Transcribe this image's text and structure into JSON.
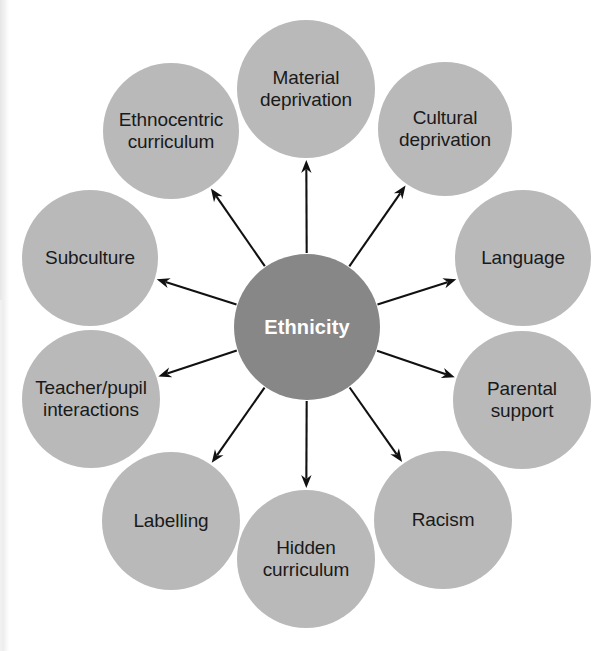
{
  "diagram": {
    "type": "radial-spoke",
    "title": "Ethnicity",
    "background_color": "#ffffff",
    "center": {
      "label": "Ethnicity",
      "cx": 307,
      "cy": 327,
      "r": 73,
      "fill": "#878787",
      "text_color": "#ffffff"
    },
    "node_style": {
      "fill": "#b9b9b9",
      "text_color": "#1a1a1a",
      "r": 69
    },
    "arrow_color": "#111111",
    "nodes": [
      {
        "id": "material-deprivation",
        "label": "Material\ndeprivation",
        "cx": 306,
        "cy": 89,
        "r": 69,
        "angle": -90
      },
      {
        "id": "cultural-deprivation",
        "label": "Cultural\ndeprivation",
        "cx": 445,
        "cy": 129,
        "r": 67,
        "angle": -54
      },
      {
        "id": "language",
        "label": "Language",
        "cx": 523,
        "cy": 258,
        "r": 68,
        "angle": -18
      },
      {
        "id": "parental-support",
        "label": "Parental\nsupport",
        "cx": 522,
        "cy": 400,
        "r": 69,
        "angle": 18
      },
      {
        "id": "racism",
        "label": "Racism",
        "cx": 443,
        "cy": 520,
        "r": 69,
        "angle": 54
      },
      {
        "id": "hidden-curriculum",
        "label": "Hidden\ncurriculum",
        "cx": 306,
        "cy": 559,
        "r": 69,
        "angle": 90
      },
      {
        "id": "labelling",
        "label": "Labelling",
        "cx": 171,
        "cy": 521,
        "r": 69,
        "angle": 126
      },
      {
        "id": "teacher-pupil",
        "label": "Teacher/pupil\ninteractions",
        "cx": 91,
        "cy": 399,
        "r": 69,
        "angle": 162
      },
      {
        "id": "subculture",
        "label": "Subculture",
        "cx": 90,
        "cy": 258,
        "r": 68,
        "angle": 198
      },
      {
        "id": "ethnocentric-curriculum",
        "label": "Ethnocentric\ncurriculum",
        "cx": 171,
        "cy": 131,
        "r": 68,
        "angle": 234
      }
    ]
  }
}
